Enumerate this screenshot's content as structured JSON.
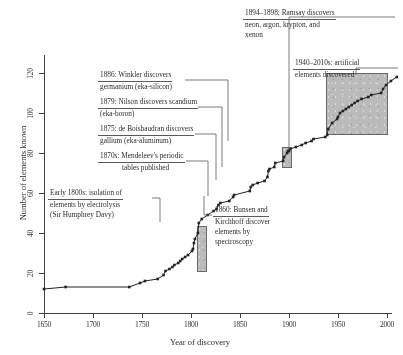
{
  "chart_data": {
    "type": "line",
    "title": "",
    "xlabel": "Year of discovery",
    "ylabel": "Number of elements known",
    "xlim": [
      1650,
      2010
    ],
    "ylim": [
      0,
      130
    ],
    "xticks": [
      1650,
      1700,
      1750,
      1800,
      1850,
      1900,
      1950,
      2000
    ],
    "yticks": [
      0,
      20,
      40,
      60,
      80,
      100,
      120
    ],
    "grid": false,
    "legend": "none",
    "marker": "filled-square",
    "series": [
      {
        "name": "Elements known",
        "points": [
          [
            1650,
            12
          ],
          [
            1672,
            13
          ],
          [
            1737,
            13
          ],
          [
            1748,
            15
          ],
          [
            1753,
            16
          ],
          [
            1766,
            17
          ],
          [
            1772,
            19
          ],
          [
            1774,
            21
          ],
          [
            1778,
            22
          ],
          [
            1781,
            23
          ],
          [
            1783,
            24
          ],
          [
            1787,
            25
          ],
          [
            1789,
            26
          ],
          [
            1791,
            27
          ],
          [
            1794,
            28
          ],
          [
            1797,
            29
          ],
          [
            1801,
            31
          ],
          [
            1802,
            32
          ],
          [
            1803,
            35
          ],
          [
            1804,
            37
          ],
          [
            1807,
            40
          ],
          [
            1808,
            45
          ],
          [
            1811,
            47
          ],
          [
            1817,
            49
          ],
          [
            1823,
            51
          ],
          [
            1826,
            52
          ],
          [
            1828,
            54
          ],
          [
            1830,
            55
          ],
          [
            1839,
            56
          ],
          [
            1843,
            58
          ],
          [
            1844,
            59
          ],
          [
            1860,
            61
          ],
          [
            1861,
            63
          ],
          [
            1863,
            64
          ],
          [
            1868,
            65
          ],
          [
            1875,
            66
          ],
          [
            1878,
            68
          ],
          [
            1879,
            71
          ],
          [
            1880,
            72
          ],
          [
            1885,
            73
          ],
          [
            1886,
            75
          ],
          [
            1894,
            76
          ],
          [
            1895,
            78
          ],
          [
            1898,
            80
          ],
          [
            1899,
            81
          ],
          [
            1900,
            81
          ],
          [
            1901,
            82
          ],
          [
            1907,
            83
          ],
          [
            1913,
            84
          ],
          [
            1917,
            85
          ],
          [
            1923,
            86
          ],
          [
            1925,
            87
          ],
          [
            1937,
            88
          ],
          [
            1939,
            89
          ],
          [
            1940,
            92
          ],
          [
            1944,
            95
          ],
          [
            1949,
            97
          ],
          [
            1950,
            98
          ],
          [
            1952,
            100
          ],
          [
            1955,
            101
          ],
          [
            1958,
            102
          ],
          [
            1961,
            103
          ],
          [
            1964,
            104
          ],
          [
            1967,
            105
          ],
          [
            1970,
            106
          ],
          [
            1974,
            107
          ],
          [
            1981,
            108
          ],
          [
            1984,
            109
          ],
          [
            1994,
            110
          ],
          [
            1996,
            112
          ],
          [
            1999,
            114
          ],
          [
            2004,
            116
          ],
          [
            2010,
            118
          ]
        ]
      }
    ],
    "highlight_boxes": [
      {
        "name": "electrolysis-era",
        "x_range": [
          1806,
          1813
        ],
        "y_range": [
          26,
          48
        ]
      },
      {
        "name": "noble-gas-era",
        "x_range": [
          1893,
          1900
        ],
        "y_range": [
          74,
          83
        ]
      },
      {
        "name": "artificial-elements-era",
        "x_range": [
          1938,
          2010
        ],
        "y_range": [
          90,
          120
        ]
      }
    ],
    "annotations": [
      {
        "id": "ramsay",
        "lines": [
          "1894–1898; Ramsay discovers",
          "neon, argon, krypton, and",
          "xenon"
        ]
      },
      {
        "id": "artificial",
        "lines": [
          "1940–2010s: artificial",
          "elements discovered"
        ]
      },
      {
        "id": "winkler",
        "lines": [
          "1886: Winkler discovers",
          "germanium (eka-silicon)"
        ]
      },
      {
        "id": "nilson",
        "lines": [
          "1879: Nilson discovers scandium",
          "(eka-boron)"
        ]
      },
      {
        "id": "boisbaudran",
        "lines": [
          "1875: de Boisbaudran discovers",
          "gallium (eka-aluminum)"
        ]
      },
      {
        "id": "mendeleev",
        "lines": [
          "1870s: Mendeleev's periodic",
          "tables  published"
        ]
      },
      {
        "id": "davy",
        "lines": [
          "Early 1800s: isolation of",
          "elements by electrolysis",
          "(Sir Humphrey Davy)"
        ]
      },
      {
        "id": "bunsen",
        "lines": [
          "1860: Bunsen and",
          "Kirchhoff discover",
          "elements by",
          "spectroscopy"
        ]
      }
    ],
    "colors": {
      "line": "#1a1a1a",
      "axis": "#3a3a3a",
      "highlight_fill": "#b0b0b0",
      "background": "#ffffff"
    }
  }
}
